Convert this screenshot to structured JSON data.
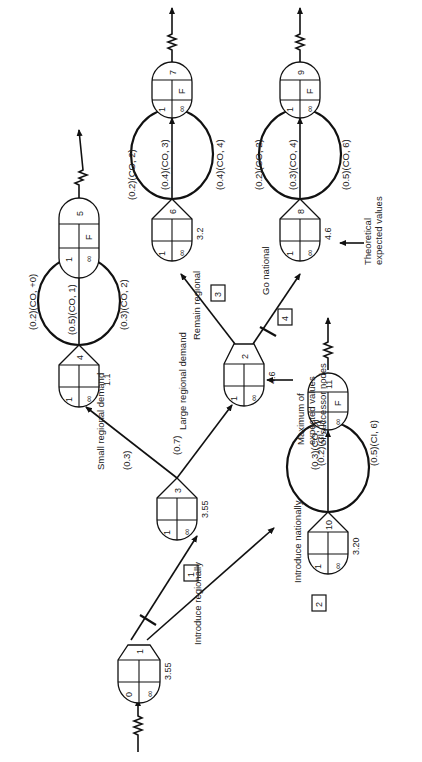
{
  "diagram": {
    "orientation": "rotated-90-ccw",
    "nodes": [
      {
        "id": "0",
        "top_left": "0",
        "top_right": "",
        "bottom_right": "∞",
        "value": "3.55"
      },
      {
        "id": "1",
        "label": "1"
      },
      {
        "id": "3",
        "top_left": "1",
        "bottom_right": "∞",
        "value": "3.55"
      },
      {
        "id": "4",
        "top_left": "1",
        "bottom_right": "∞",
        "value": "1.1"
      },
      {
        "id": "5",
        "top_left": "1",
        "mid_right": "F",
        "bottom_right": "∞"
      },
      {
        "id": "2",
        "top_left": "1",
        "bottom_right": "∞",
        "value": "4.6"
      },
      {
        "id": "6",
        "top_left": "1",
        "bottom_right": "∞",
        "value": "3.2"
      },
      {
        "id": "7",
        "top_left": "1",
        "mid_right": "F",
        "bottom_right": "∞"
      },
      {
        "id": "8",
        "top_left": "1",
        "bottom_right": "∞",
        "value": "4.6"
      },
      {
        "id": "9",
        "top_left": "1",
        "mid_right": "F",
        "bottom_right": "∞"
      },
      {
        "id": "10",
        "top_left": "1",
        "bottom_right": "∞",
        "value": "3.20"
      },
      {
        "id": "11",
        "top_left": "1",
        "mid_right": "F",
        "bottom_right": "∞"
      }
    ],
    "decisions": [
      {
        "box": "1",
        "label": "Introduce regionally"
      },
      {
        "box": "2",
        "label": "Introduce nationally"
      },
      {
        "box": "3",
        "label": "Remain regional"
      },
      {
        "box": "4",
        "label": "Go national"
      }
    ],
    "branches": {
      "small_regional": {
        "label": "Small regional demand",
        "prob": "(0.3)"
      },
      "large_regional": {
        "label": "Large regional demand",
        "prob": "(0.7)"
      }
    },
    "outcomes": {
      "node4": [
        "(0.2)(CO, +0)",
        "(0.5)(CO, 1)",
        "(0.3)(CO, 2)"
      ],
      "node6": [
        "(0.2)(CO, 2)",
        "(0.4)(CO, 3)",
        "(0.4)(CO, 4)"
      ],
      "node8": [
        "(0.2)(CO, 2)",
        "(0.3)(CO, 4)",
        "(0.5)(CO, 6)"
      ],
      "node10": [
        "(0.3)(CO, 0)",
        "(0.2)(CI, 1)",
        "(0.5)(CI, 6)"
      ]
    },
    "annotations": {
      "max_expected": "Maximum of expected values of successor nodes",
      "theoretical": "Theoretical expected values"
    }
  }
}
